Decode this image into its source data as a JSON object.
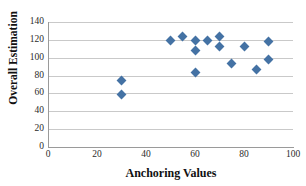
{
  "chart_data": {
    "type": "scatter",
    "title": "",
    "xlabel": "Anchoring Values",
    "ylabel": "Overall Estimation",
    "xlim": [
      0,
      100
    ],
    "ylim": [
      0,
      140
    ],
    "xticks": [
      0,
      20,
      40,
      60,
      80,
      100
    ],
    "yticks": [
      0,
      20,
      40,
      60,
      80,
      100,
      120,
      140
    ],
    "grid": "horizontal",
    "legend": "none",
    "series": [
      {
        "name": "Overall Estimation",
        "marker": "diamond",
        "color": "#4472a4",
        "points": [
          {
            "x": 30,
            "y": 74
          },
          {
            "x": 30,
            "y": 59
          },
          {
            "x": 50,
            "y": 119
          },
          {
            "x": 55,
            "y": 123.5
          },
          {
            "x": 60,
            "y": 119
          },
          {
            "x": 60,
            "y": 108.5
          },
          {
            "x": 60,
            "y": 83.5
          },
          {
            "x": 65,
            "y": 119
          },
          {
            "x": 70,
            "y": 123.5
          },
          {
            "x": 70,
            "y": 113
          },
          {
            "x": 75,
            "y": 93
          },
          {
            "x": 80,
            "y": 112.5
          },
          {
            "x": 85,
            "y": 87
          },
          {
            "x": 90,
            "y": 118
          },
          {
            "x": 90,
            "y": 97.5
          }
        ]
      }
    ]
  }
}
